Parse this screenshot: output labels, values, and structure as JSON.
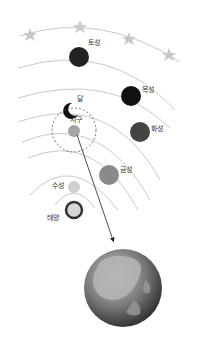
{
  "diagram": {
    "title": "",
    "labels": {
      "saturn": "토성",
      "jupiter": "목성",
      "moon": "달",
      "earth": "지구",
      "mars": "화성",
      "venus": "금성",
      "mercury": "수성",
      "sun": "태양"
    },
    "colors": {
      "orbit": "#bbbbbb",
      "star": "#c8c8c8",
      "saturn": "#222222",
      "jupiter": "#111111",
      "mars": "#444444",
      "venus": "#8a8a8a",
      "mercury": "#cfcfcf",
      "earth": "#a5a5a5",
      "sun_fill": "#d6d6d6",
      "sun_ring": "#333333"
    }
  }
}
